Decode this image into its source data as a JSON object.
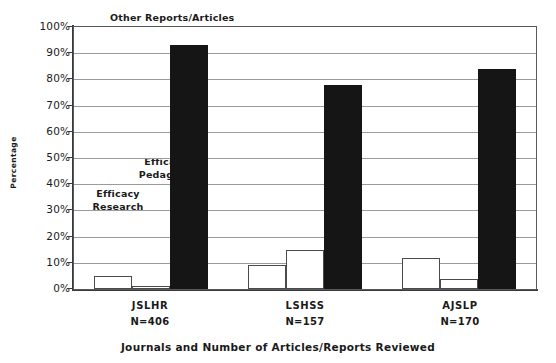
{
  "chart_data": {
    "type": "bar",
    "title": "Other Reports/Articles",
    "xlabel": "Journals and Number of Articles/Reports Reviewed",
    "ylabel": "Percentage",
    "ylim": [
      0,
      100
    ],
    "ytick_labels": [
      "0%",
      "10%",
      "20%",
      "30%",
      "40%",
      "50%",
      "60%",
      "70%",
      "80%",
      "90%",
      "100%"
    ],
    "ytick_values": [
      0,
      10,
      20,
      30,
      40,
      50,
      60,
      70,
      80,
      90,
      100
    ],
    "grid": true,
    "legend_position": "in-plot annotations",
    "categories": [
      "JSLHR",
      "LSHSS",
      "AJSLP"
    ],
    "category_counts": [
      "N=406",
      "N=157",
      "N=170"
    ],
    "series": [
      {
        "name": "Efficacy Research",
        "color": "#ffffff",
        "values": [
          5,
          9,
          12
        ]
      },
      {
        "name": "Efficacy Pedagogy",
        "color": "#ffffff",
        "values": [
          1,
          15,
          4
        ]
      },
      {
        "name": "Other Reports/Articles",
        "color": "#151515",
        "values": [
          93,
          78,
          84
        ]
      }
    ],
    "annotations": [
      {
        "text_line1": "Efficacy",
        "text_line2": "Pedagogy"
      },
      {
        "text_line1": "Efficacy",
        "text_line2": "Research"
      }
    ]
  },
  "chart": {
    "title": "Other Reports/Articles",
    "xlabel": "Journals and Number of Articles/Reports Reviewed",
    "ylabel": "Percentage",
    "annot_pedagogy_1": "Efficacy",
    "annot_pedagogy_2": "Pedagogy",
    "annot_research_1": "Efficacy",
    "annot_research_2": "Research",
    "cat0_name": "JSLHR",
    "cat0_n": "N=406",
    "cat1_name": "LSHSS",
    "cat1_n": "N=157",
    "cat2_name": "AJSLP",
    "cat2_n": "N=170"
  }
}
